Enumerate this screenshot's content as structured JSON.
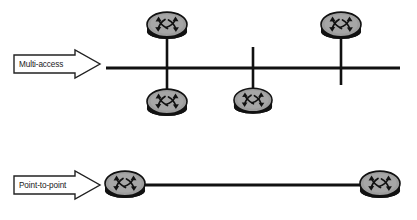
{
  "diagram": {
    "background_color": "#ffffff",
    "line_color": "#111111",
    "router_body_color": "#9d9d9d",
    "router_edge_color": "#111111",
    "router_base_color": "#121212",
    "arrow_fill_color": "#ffffff",
    "arrow_stroke_color": "#222222",
    "rows": [
      {
        "id": "multi-access",
        "label": "Multi-access",
        "arrow": {
          "x": 14,
          "y": 50,
          "width": 86,
          "height": 28
        },
        "bus": {
          "x1": 106,
          "y1": 68,
          "x2": 400,
          "y2": 68,
          "width": 3
        },
        "stubs": [
          {
            "id": "stub-left",
            "x": 167,
            "y1": 38,
            "y2": 92
          },
          {
            "id": "stub-middle",
            "x": 253,
            "y1": 48,
            "y2": 92
          },
          {
            "id": "stub-right",
            "x": 341,
            "y1": 38,
            "y2": 85
          }
        ],
        "routers": [
          {
            "id": "router-top-left",
            "cx": 167,
            "cy": 24,
            "rx": 21,
            "ry": 14,
            "position": "above-bus"
          },
          {
            "id": "router-top-right",
            "cx": 341,
            "cy": 24,
            "rx": 21,
            "ry": 14,
            "position": "above-bus"
          },
          {
            "id": "router-bottom-left",
            "cx": 167,
            "cy": 100,
            "rx": 21,
            "ry": 14,
            "position": "below-bus"
          },
          {
            "id": "router-bottom-middle",
            "cx": 253,
            "cy": 99,
            "rx": 20,
            "ry": 13,
            "position": "below-bus"
          }
        ]
      },
      {
        "id": "point-to-point",
        "label": "Point-to-point",
        "arrow": {
          "x": 14,
          "y": 172,
          "width": 86,
          "height": 27
        },
        "link": {
          "x1": 145,
          "y1": 185,
          "x2": 363,
          "y2": 185,
          "width": 3
        },
        "routers": [
          {
            "id": "router-p2p-left",
            "cx": 125,
            "cy": 183,
            "rx": 21,
            "ry": 14,
            "position": "left-endpoint"
          },
          {
            "id": "router-p2p-right",
            "cx": 380,
            "cy": 183,
            "rx": 21,
            "ry": 14,
            "position": "right-endpoint"
          }
        ]
      }
    ]
  }
}
